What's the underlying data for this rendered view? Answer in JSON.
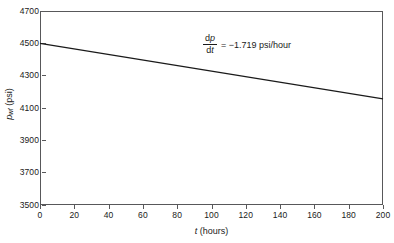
{
  "chart_data": {
    "type": "line",
    "title": "",
    "xlabel": "t (hours)",
    "ylabel": "p_wf (psi)",
    "xlabel_parts": {
      "symbol": "t",
      "units": "(hours)"
    },
    "ylabel_parts": {
      "symbol": "p",
      "subscript": "wf",
      "units": "(psi)"
    },
    "xlim": [
      0,
      200
    ],
    "ylim": [
      3500,
      4700
    ],
    "xticks": [
      0,
      20,
      40,
      60,
      80,
      100,
      120,
      140,
      160,
      180,
      200
    ],
    "yticks": [
      3500,
      3700,
      3900,
      4100,
      4300,
      4500,
      4700
    ],
    "grid": false,
    "legend": false,
    "series": [
      {
        "name": "bottomhole flowing pressure",
        "x": [
          0,
          200
        ],
        "values": [
          4500,
          4156.2
        ],
        "color": "#1a1a1a",
        "slope": -1.719,
        "intercept": 4500
      }
    ],
    "annotations": [
      {
        "name": "slope-annotation",
        "numerator": "dp",
        "denominator": "dt",
        "relation": "= −1.719 psi/hour",
        "value": -1.719,
        "units": "psi/hour",
        "x": 100,
        "y": 4575
      }
    ],
    "frame_color": "#58585a",
    "background": "#ffffff"
  }
}
